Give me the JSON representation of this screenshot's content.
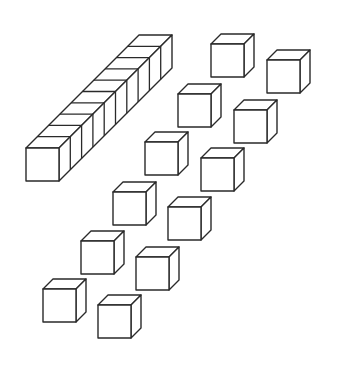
{
  "diagram": {
    "title": "",
    "colors": {
      "stroke": "#2a2a2a",
      "fill": "#ffffff",
      "background": "#ffffff"
    },
    "cube_size": 33,
    "depth_offset": 10,
    "rod": {
      "label": "ten-rod",
      "units": 10,
      "front_x": 26,
      "front_y": 148,
      "size": 33,
      "step": 11.3
    },
    "unit_cubes": [
      {
        "x": 211,
        "y": 44
      },
      {
        "x": 267,
        "y": 60
      },
      {
        "x": 178,
        "y": 94
      },
      {
        "x": 234,
        "y": 110
      },
      {
        "x": 145,
        "y": 142
      },
      {
        "x": 201,
        "y": 158
      },
      {
        "x": 113,
        "y": 192
      },
      {
        "x": 168,
        "y": 207
      },
      {
        "x": 81,
        "y": 241
      },
      {
        "x": 136,
        "y": 257
      },
      {
        "x": 43,
        "y": 289
      },
      {
        "x": 98,
        "y": 305
      }
    ],
    "counts": {
      "rods": 1,
      "units": 12,
      "total_value": 22
    }
  }
}
